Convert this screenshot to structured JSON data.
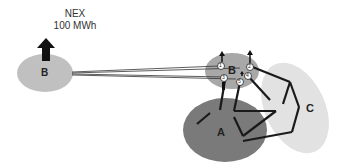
{
  "title": {
    "line1": "NEX",
    "line2": "100 MWh"
  },
  "regions": [
    {
      "id": "B_remote",
      "label": "B",
      "color": "#c0c0c0"
    },
    {
      "id": "B_local",
      "label": "B",
      "color": "#a8a8a8"
    },
    {
      "id": "A",
      "label": "A",
      "color": "#7a7a7a"
    },
    {
      "id": "C",
      "label": "C",
      "color": "#e2e2e2"
    }
  ],
  "nodes": [
    {
      "id": "n1",
      "label": "1"
    },
    {
      "id": "n2",
      "label": "2"
    },
    {
      "id": "n3",
      "label": "3"
    },
    {
      "id": "n4",
      "label": "4"
    },
    {
      "id": "n5",
      "label": "5"
    }
  ],
  "colors": {
    "arrow": "#111111",
    "line": "#1a1a1a",
    "node_fill": "#ffffff"
  }
}
